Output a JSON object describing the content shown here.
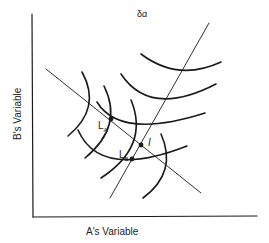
{
  "diagram": {
    "title": "δα",
    "x_axis_label": "A's Variable",
    "y_axis_label": "B's Variable",
    "points": [
      {
        "id": "LA",
        "label": "L",
        "subscript": "A",
        "x": 111,
        "y": 119
      },
      {
        "id": "LB",
        "label": "L",
        "subscript": "B",
        "x": 132,
        "y": 159
      },
      {
        "id": "I",
        "label": "I",
        "x": 141,
        "y": 145
      }
    ],
    "lines": [
      {
        "name": "downward-sloping-line",
        "from": [
          46,
          69
        ],
        "to": [
          201,
          193
        ]
      },
      {
        "name": "upward-sloping-line",
        "from": [
          110,
          198
        ],
        "to": [
          209,
          23
        ]
      }
    ],
    "colors": {
      "ink": "#1a1a1a",
      "background": "#ffffff"
    }
  }
}
